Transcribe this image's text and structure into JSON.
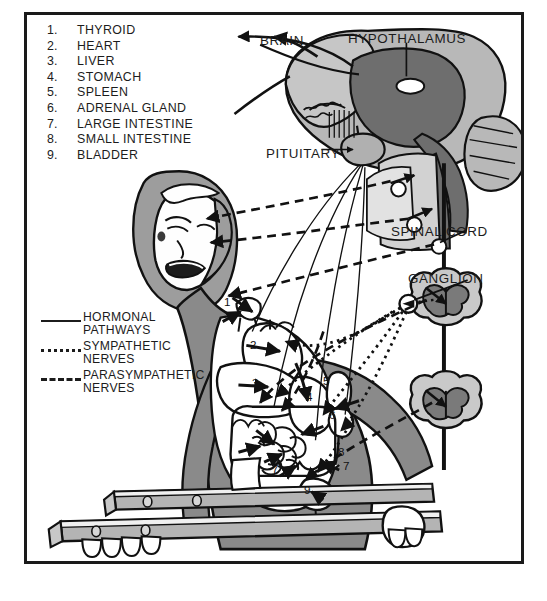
{
  "figure": {
    "title_alt": "Neuroendocrine pathways diagram of a gymnast on parallel bars",
    "background": "#ffffff",
    "border_color": "#1a1a1a",
    "palette": {
      "ink": "#1c1c1c",
      "body_gray": "#808080",
      "mid_gray": "#a8a8a8",
      "light_gray": "#c9c9c9",
      "pale_gray": "#dcdcdc",
      "organ_white": "#ffffff",
      "dark_gray": "#6e6e6e"
    }
  },
  "organ_key": {
    "heading": "",
    "items": [
      {
        "num": "1.",
        "label": "THYROID"
      },
      {
        "num": "2.",
        "label": "HEART"
      },
      {
        "num": "3.",
        "label": "LIVER"
      },
      {
        "num": "4.",
        "label": "STOMACH"
      },
      {
        "num": "5.",
        "label": "SPLEEN"
      },
      {
        "num": "6.",
        "label": "ADRENAL GLAND"
      },
      {
        "num": "7.",
        "label": "LARGE INTESTINE"
      },
      {
        "num": "8.",
        "label": "SMALL INTESTINE"
      },
      {
        "num": "9.",
        "label": "BLADDER"
      }
    ]
  },
  "legend": {
    "entries": [
      {
        "style": "solid",
        "label": "HORMONAL\nPATHWAYS"
      },
      {
        "style": "dotted",
        "label": "SYMPATHETIC\nNERVES"
      },
      {
        "style": "dashed",
        "label": "PARASYMPATHETIC\nNERVES"
      }
    ]
  },
  "callouts": [
    {
      "id": "brain",
      "label": "BRAIN"
    },
    {
      "id": "hypothalamus",
      "label": "HYPOTHALAMUS"
    },
    {
      "id": "pituitary",
      "label": "PITUITARY"
    },
    {
      "id": "spinal_cord",
      "label": "SPINAL CORD"
    },
    {
      "id": "ganglion",
      "label": "GANGLION"
    }
  ],
  "organ_markers": [
    {
      "n": "1",
      "organ": "THYROID",
      "x": 221,
      "y": 292
    },
    {
      "n": "2",
      "organ": "HEART",
      "x": 247,
      "y": 335
    },
    {
      "n": "3",
      "organ": "LIVER",
      "x": 249,
      "y": 373
    },
    {
      "n": "4",
      "organ": "STOMACH",
      "x": 303,
      "y": 387
    },
    {
      "n": "5",
      "organ": "SPLEEN",
      "x": 320,
      "y": 371
    },
    {
      "n": "6",
      "organ": "ADRENAL GLAND",
      "x": 326,
      "y": 405
    },
    {
      "n": "7",
      "organ": "LARGE INTESTINE",
      "x": 269,
      "y": 459
    },
    {
      "n": "7",
      "organ": "LARGE INTESTINE",
      "x": 340,
      "y": 456
    },
    {
      "n": "8",
      "organ": "SMALL INTESTINE",
      "x": 335,
      "y": 442
    },
    {
      "n": "9",
      "organ": "BLADDER",
      "x": 301,
      "y": 480
    }
  ]
}
